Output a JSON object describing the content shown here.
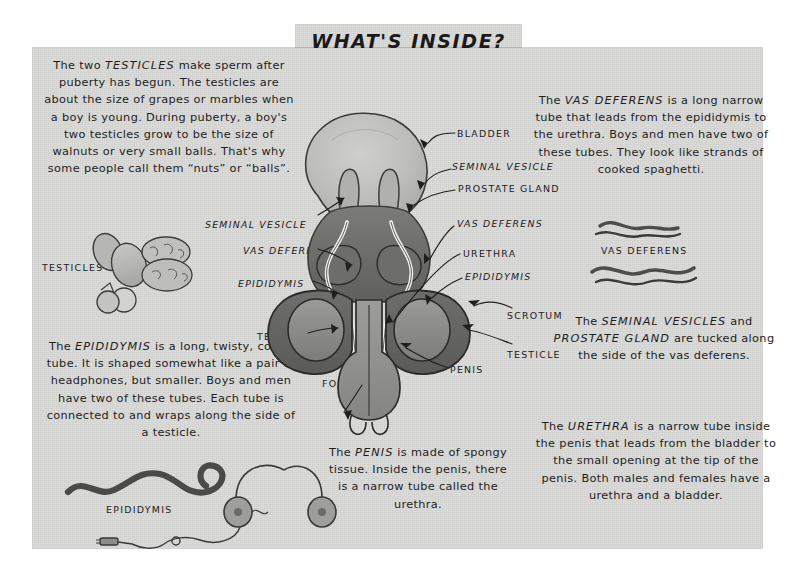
{
  "page": {
    "title": "WHAT'S INSIDE?",
    "paper_color": "#d6d6d4",
    "ink_color": "#1c1c1c"
  },
  "paragraphs": {
    "testicles": "The two TESTICLES make sperm after puberty has begun. The testicles are about the size of grapes or marbles when a boy is young. During puberty, a boy's two testicles grow to be the size of walnuts or very small balls. That's why some people call them “nuts” or “balls”.",
    "vas_deferens": "The VAS DEFERENS is a long narrow tube that leads from the epididymis to the urethra. Boys and men have two of these tubes. They look like strands of cooked spaghetti.",
    "epididymis": "The EPIDIDYMIS is a long, twisty, coiled tube. It is shaped somewhat like a pair of headphones, but smaller. Boys and men have two of these tubes. Each tube is connected to and wraps along the side of a testicle.",
    "seminal_vesicles": "The SEMINAL VESICLES and PROSTATE GLAND are tucked along the side of the vas deferens.",
    "penis": "The PENIS is made of spongy tissue. Inside the penis, there is a narrow tube called the urethra.",
    "urethra": "The URETHRA is a narrow tube inside the penis that leads from the bladder to the small opening at the tip of the penis. Both males and females have a urethra and a bladder."
  },
  "diagram_labels": {
    "bladder": "BLADDER",
    "seminal_vesicle_right": "SEMINAL VESICLE",
    "prostate_gland": "PROSTATE GLAND",
    "vas_deferens_right": "VAS DEFERENS",
    "urethra": "URETHRA",
    "epididymis_right": "EPIDIDYMIS",
    "scrotum": "SCROTUM",
    "testicle_right": "TESTICLE",
    "penis": "PENIS",
    "foreskin": "FORESKIN",
    "seminal_vesicle_left": "SEMINAL VESICLE",
    "vas_deferens_left": "VAS DEFERENS",
    "epididymis_left": "EPIDIDYMIS",
    "testicle_left": "TESTICLE"
  },
  "illustration_captions": {
    "testicles": "TESTICLES",
    "vas_deferens": "VAS DEFERENS",
    "epididymis": "EPIDIDYMIS"
  }
}
